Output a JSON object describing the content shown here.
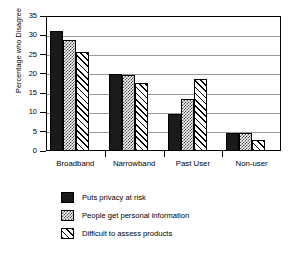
{
  "chart_data": {
    "type": "bar",
    "title": "",
    "xlabel": "",
    "ylabel": "Percentage who Disagree",
    "ylim": [
      0,
      35
    ],
    "yticks": [
      0,
      5,
      10,
      15,
      20,
      25,
      30,
      35
    ],
    "ytick_labels": [
      "0",
      "5",
      "10",
      "15",
      "20",
      "25",
      "30",
      "35"
    ],
    "grid": "horizontal",
    "legend_position": "below",
    "categories": [
      "Broadband",
      "Narrowband",
      "Past User",
      "Non-user"
    ],
    "series": [
      {
        "name": "Puts privacy at risk",
        "pattern": "solid-black",
        "color": "#1a1a1a",
        "values": [
          31,
          20,
          9.5,
          4.8
        ]
      },
      {
        "name": "People get personal information",
        "pattern": "checkered-gray",
        "color": "#4d4d4d",
        "values": [
          28.7,
          19.8,
          13.6,
          4.6
        ]
      },
      {
        "name": "Difficult to assess products",
        "pattern": "diagonal-hatch",
        "color": "#000000",
        "values": [
          25.8,
          17.6,
          18.6,
          2.8
        ]
      }
    ]
  },
  "axis": {
    "y_title": "Percentage who Disagree"
  },
  "legend": {
    "items": [
      {
        "label": "Puts privacy at risk"
      },
      {
        "label": "People get personal information"
      },
      {
        "label": "Difficult to assess products"
      }
    ]
  }
}
